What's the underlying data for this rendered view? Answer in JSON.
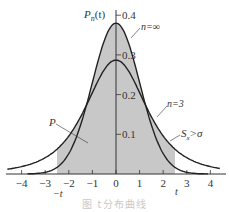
{
  "chart_data": {
    "type": "area",
    "title": "",
    "ylabel": "P_n(t)",
    "xlabel": "t",
    "xlim": [
      -4.6,
      4.6
    ],
    "ylim": [
      0,
      0.4
    ],
    "x_ticks": [
      -4,
      -3,
      -2,
      -1,
      0,
      1,
      2,
      3,
      4
    ],
    "x_tick_labels": [
      "−4",
      "−3",
      "−2",
      "−1",
      "0",
      "1",
      "2",
      "3",
      "4"
    ],
    "y_ticks": [
      0.1,
      0.2,
      0.3,
      0.4
    ],
    "y_tick_labels": [
      "0.1",
      "0.2",
      "0.3",
      "0.4"
    ],
    "grid": false,
    "legend": "none (inline curve labels)",
    "series": [
      {
        "name": "n=∞",
        "description": "standard normal curve (σ known)",
        "peak": 0.38,
        "scale": 1.0
      },
      {
        "name": "n=3",
        "description": "t-distribution, S_x > σ, heavier tails",
        "peak": 0.287,
        "scale": 1.35
      }
    ],
    "shaded_region": {
      "from": -2.5,
      "to": 2.5,
      "label": "P",
      "fill": "#c8c8c8"
    },
    "annotations": [
      {
        "text": "n=∞",
        "target": "normal curve"
      },
      {
        "text": "n=3",
        "target": "t curve"
      },
      {
        "text": "S_x>σ",
        "target": "t curve tail"
      },
      {
        "text": "P",
        "target": "shaded area"
      },
      {
        "text": "−t",
        "position": "below x axis at -2.5"
      },
      {
        "text": "t",
        "position": "below x axis at 2.5"
      }
    ]
  },
  "labels": {
    "y_axis": "P",
    "y_axis_sub": "n",
    "y_axis_arg": "(t)",
    "n_inf": "n=∞",
    "n_3": "n=3",
    "sx": "S",
    "sx_sub": "x",
    "sx_rest": ">σ",
    "p": "P",
    "neg_t": "−t",
    "pos_t": "t",
    "caption": "图 t分布曲线"
  },
  "colors": {
    "curve": "#222222",
    "shade": "#c8c8c8",
    "axis": "#333333"
  }
}
